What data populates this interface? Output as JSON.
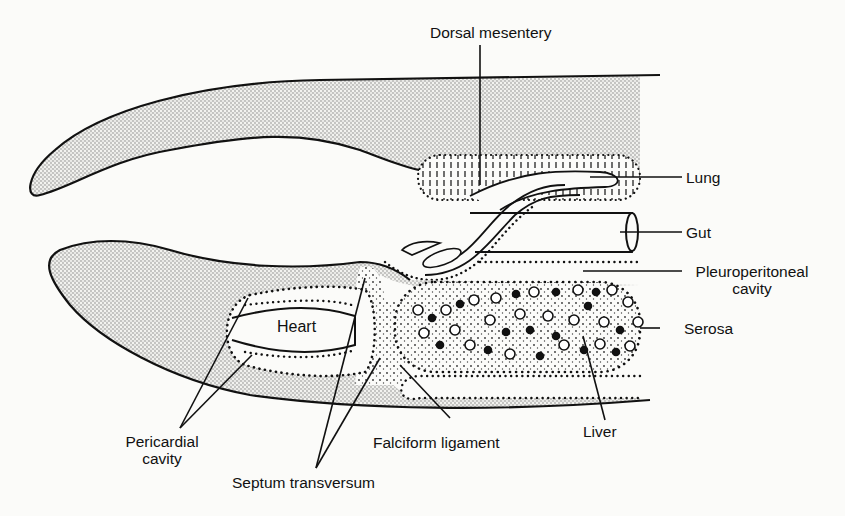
{
  "figure": {
    "type": "anatomical-diagram",
    "colors": {
      "ink": "#111111",
      "stipple": "#8a8a8a",
      "background": "#fbfbf9"
    }
  },
  "labels": {
    "dorsal_mesentery": "Dorsal mesentery",
    "lung": "Lung",
    "gut": "Gut",
    "pleuroperitoneal_line1": "Pleuroperitoneal",
    "pleuroperitoneal_line2": "cavity",
    "serosa": "Serosa",
    "heart": "Heart",
    "liver": "Liver",
    "falciform_ligament": "Falciform ligament",
    "pericardial_line1": "Pericardial",
    "pericardial_line2": "cavity",
    "septum_transversum": "Septum transversum"
  }
}
